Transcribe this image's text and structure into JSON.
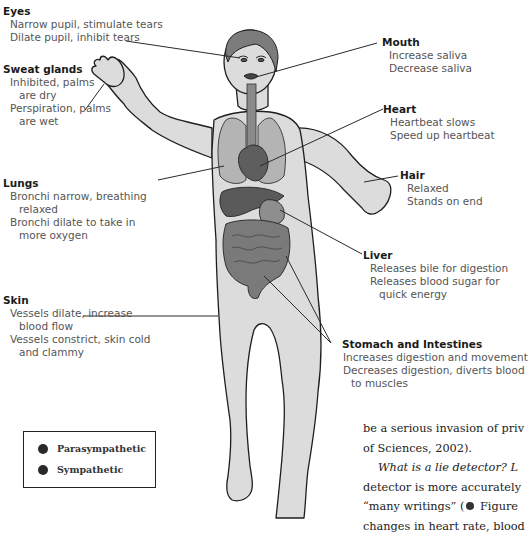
{
  "figure": {
    "labels": {
      "eyes": {
        "heading": "Eyes",
        "lines": [
          "Narrow pupil, stimulate tears",
          "Dilate pupil, inhibit tears"
        ]
      },
      "sweat_glands": {
        "heading": "Sweat glands",
        "lines": [
          "Inhibited, palms",
          "are dry",
          "Perspiration, palms",
          "are wet"
        ]
      },
      "lungs": {
        "heading": "Lungs",
        "lines": [
          "Bronchi narrow, breathing",
          "relaxed",
          "Bronchi dilate to take in",
          "more oxygen"
        ]
      },
      "skin": {
        "heading": "Skin",
        "lines": [
          "Vessels dilate, increase",
          "blood flow",
          "Vessels constrict, skin cold",
          "and clammy"
        ]
      },
      "mouth": {
        "heading": "Mouth",
        "lines": [
          "Increase saliva",
          "Decrease saliva"
        ]
      },
      "heart": {
        "heading": "Heart",
        "lines": [
          "Heartbeat slows",
          "Speed up heartbeat"
        ]
      },
      "hair": {
        "heading": "Hair",
        "lines": [
          "Relaxed",
          "Stands on end"
        ]
      },
      "liver": {
        "heading": "Liver",
        "lines": [
          "Releases bile for digestion",
          "Releases blood sugar for",
          "quick energy"
        ]
      },
      "stomach": {
        "heading": "Stomach and Intestines",
        "lines": [
          "Increases digestion and movement",
          "Decreases digestion, diverts blood",
          "to muscles"
        ]
      }
    },
    "legend": {
      "items": [
        {
          "label": "Parasympathetic",
          "color": "#2a2a2a"
        },
        {
          "label": "Sympathetic",
          "color": "#2a2a2a"
        }
      ]
    },
    "colors": {
      "body_fill": "#dcdcdc",
      "outline": "#1e1e1e",
      "organ_dark": "#6a6a6a",
      "organ_mid": "#8a8a8a",
      "hair_fill": "#7c7c7c"
    }
  },
  "body_text": {
    "line1": "be a serious invasion of priv",
    "line2": "of Sciences, 2002).",
    "line3_italic": "What is a lie detector? L",
    "line4": "detector is more accurately",
    "line5_a": "“many writings” (",
    "line5_b": " Figure",
    "line6": "changes in heart rate, blood"
  }
}
